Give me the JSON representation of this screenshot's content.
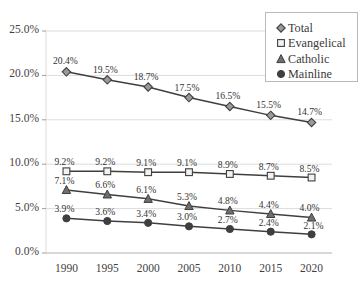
{
  "chart_data": {
    "type": "line",
    "title": "",
    "subtitle": "",
    "xlabel": "",
    "ylabel": "",
    "categories": [
      "1990",
      "1995",
      "2000",
      "2005",
      "2010",
      "2015",
      "2020"
    ],
    "x": [
      1990,
      1995,
      2000,
      2005,
      2010,
      2015,
      2020
    ],
    "ylim": [
      0,
      25
    ],
    "y_ticks": [
      0,
      5,
      10,
      15,
      20,
      25
    ],
    "y_tick_labels": [
      "0.0%",
      "5.0%",
      "10.0%",
      "15.0%",
      "20.0%",
      "25.0%"
    ],
    "grid": true,
    "legend_position": "top-right",
    "value_suffix": "%",
    "series": [
      {
        "name": "Total",
        "marker": "diamond",
        "values": [
          20.4,
          19.5,
          18.7,
          17.5,
          16.5,
          15.5,
          14.7
        ],
        "labels": [
          "20.4%",
          "19.5%",
          "18.7%",
          "17.5%",
          "16.5%",
          "15.5%",
          "14.7%"
        ]
      },
      {
        "name": "Evangelical",
        "marker": "square",
        "values": [
          9.2,
          9.2,
          9.1,
          9.1,
          8.9,
          8.7,
          8.5
        ],
        "labels": [
          "9.2%",
          "9.2%",
          "9.1%",
          "9.1%",
          "8.9%",
          "8.7%",
          "8.5%"
        ]
      },
      {
        "name": "Catholic",
        "marker": "triangle",
        "values": [
          7.1,
          6.6,
          6.1,
          5.3,
          4.8,
          4.4,
          4.0
        ],
        "labels": [
          "7.1%",
          "6.6%",
          "6.1%",
          "5.3%",
          "4.8%",
          "4.4%",
          "4.0%"
        ]
      },
      {
        "name": "Mainline",
        "marker": "circle",
        "values": [
          3.9,
          3.6,
          3.4,
          3.0,
          2.7,
          2.4,
          2.1
        ],
        "labels": [
          "3.9%",
          "3.6%",
          "3.4%",
          "3.0%",
          "2.7%",
          "2.4%",
          "2.1%"
        ]
      }
    ],
    "colors": {
      "line": "#3f3f3f",
      "marker_fill": "#9a9a9a",
      "marker_fill_dark": "#3f3f3f",
      "marker_fill_light": "#f2f2f2",
      "grid": "#dcdcdc",
      "text": "#3a3a3a",
      "background": "#ffffff",
      "legend_border": "#b9b9b9"
    }
  },
  "legend": {
    "items": [
      {
        "label": "Total",
        "marker": "diamond"
      },
      {
        "label": "Evangelical",
        "marker": "square"
      },
      {
        "label": "Catholic",
        "marker": "triangle"
      },
      {
        "label": "Mainline",
        "marker": "circle"
      }
    ]
  }
}
